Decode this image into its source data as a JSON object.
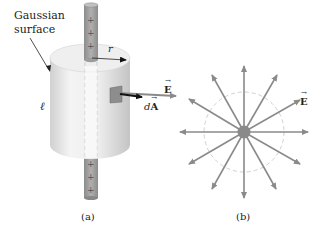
{
  "figure_a": {
    "label_gaussian_line1": "Gaussian",
    "label_gaussian_line2": "surface",
    "label_r": "r",
    "label_length": "ℓ",
    "label_E": "E",
    "label_dA_d": "d",
    "label_dA_A": "A",
    "rod_charges": [
      "+",
      "+",
      "+",
      "+",
      "+",
      "+"
    ],
    "caption": "(a)"
  },
  "figure_b": {
    "label_E": "E",
    "ray_count": 12,
    "caption": "(b)"
  },
  "colors": {
    "rod": "#9a9a9a",
    "cylinder_light": "#f2f2f2",
    "cylinder_dark": "#c8c8c8",
    "field_line": "#8a8a8a",
    "dA_arrow": "#111111",
    "dashed": "#cccccc"
  }
}
